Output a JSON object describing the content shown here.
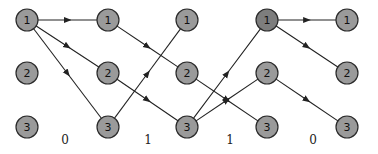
{
  "diagram": {
    "type": "trellis",
    "columns_x": [
      27,
      108,
      187,
      267,
      347
    ],
    "rows_y": [
      20,
      73,
      127
    ],
    "node_radius": 11,
    "node_labels": [
      "1",
      "2",
      "3"
    ],
    "highlighted_nodes": [
      [
        3,
        0
      ]
    ],
    "edges": [
      {
        "from": [
          0,
          0
        ],
        "to": [
          1,
          0
        ]
      },
      {
        "from": [
          0,
          0
        ],
        "to": [
          1,
          1
        ]
      },
      {
        "from": [
          0,
          0
        ],
        "to": [
          1,
          2
        ]
      },
      {
        "from": [
          1,
          0
        ],
        "to": [
          2,
          1
        ]
      },
      {
        "from": [
          1,
          1
        ],
        "to": [
          2,
          2
        ]
      },
      {
        "from": [
          1,
          2
        ],
        "to": [
          2,
          0
        ]
      },
      {
        "from": [
          2,
          1
        ],
        "to": [
          3,
          2
        ]
      },
      {
        "from": [
          2,
          2
        ],
        "to": [
          3,
          0
        ]
      },
      {
        "from": [
          2,
          2
        ],
        "to": [
          3,
          1
        ]
      },
      {
        "from": [
          3,
          0
        ],
        "to": [
          4,
          0
        ]
      },
      {
        "from": [
          3,
          0
        ],
        "to": [
          4,
          1
        ]
      },
      {
        "from": [
          3,
          1
        ],
        "to": [
          4,
          2
        ]
      }
    ],
    "stage_labels": [
      {
        "text": "0",
        "x": 65
      },
      {
        "text": "1",
        "x": 148
      },
      {
        "text": "1",
        "x": 230
      },
      {
        "text": "0",
        "x": 313
      }
    ],
    "stage_label_y": 144
  }
}
